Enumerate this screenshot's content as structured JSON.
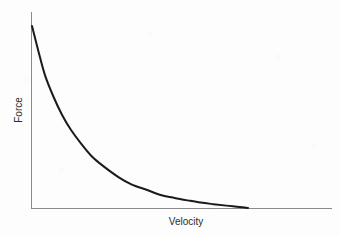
{
  "chart_data": {
    "type": "line",
    "title": "",
    "subtitle": "",
    "xlabel": "Velocity",
    "ylabel": "Force",
    "grid": false,
    "legend": null,
    "legend_position": "none",
    "axis_ticks": {
      "x": [],
      "y": []
    },
    "xlim": [
      0,
      1
    ],
    "ylim": [
      0,
      1
    ],
    "annotations": [],
    "series": [
      {
        "name": "Force vs Velocity",
        "color": "#1a1a1a",
        "linewidth": 2,
        "x": [
          0.0,
          0.03,
          0.06,
          0.1,
          0.14,
          0.18,
          0.23,
          0.28,
          0.33,
          0.4,
          0.46,
          0.53,
          0.6,
          0.66,
          0.72,
          0.78,
          0.84,
          0.9,
          0.96,
          1.0
        ],
        "y": [
          1.0,
          0.86,
          0.73,
          0.61,
          0.51,
          0.43,
          0.35,
          0.28,
          0.23,
          0.17,
          0.13,
          0.1,
          0.07,
          0.055,
          0.042,
          0.03,
          0.021,
          0.013,
          0.006,
          0.0
        ]
      }
    ]
  },
  "axes": {
    "y_axis_label": "Force",
    "x_axis_label": "Velocity",
    "axis_color": "#8a8a8a"
  },
  "colors": {
    "curve": "#1a1a1a",
    "axis": "#8a8a8a",
    "background": "#fdfdfd",
    "text": "#2b2b2b"
  }
}
